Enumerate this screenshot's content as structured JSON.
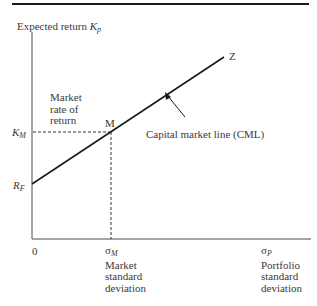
{
  "diagram": {
    "title": "Capital market line",
    "y_axis": {
      "label": "Expected return",
      "symbol": "K",
      "symbol_sub": "p"
    },
    "x_axis": {
      "origin": "0",
      "tick_market": {
        "symbol": "σ",
        "sub": "M",
        "lines": [
          "Market",
          "standard",
          "deviation"
        ]
      },
      "tick_portfolio": {
        "symbol": "σ",
        "sub": "P",
        "lines": [
          "Portfolio",
          "standard",
          "deviation"
        ]
      }
    },
    "y_ticks": {
      "km": {
        "symbol": "K",
        "sub": "M"
      },
      "rf": {
        "symbol": "R",
        "sub": "F"
      }
    },
    "annotations": {
      "market_rate": [
        "Market",
        "rate of",
        "return"
      ],
      "point_m": "M",
      "point_z": "Z",
      "cml": "Capital market line (CML)"
    },
    "colors": {
      "line": "#1a1a1a",
      "text": "#3a3a3a",
      "background": "#ffffff"
    }
  }
}
